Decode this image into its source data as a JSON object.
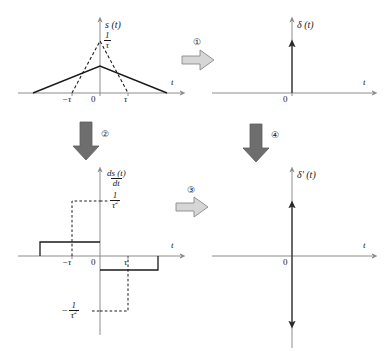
{
  "figure": {
    "colors": {
      "axis": "#8c8c8c",
      "curve": "#1a1a1a",
      "dashed": "#1a1a1a",
      "arrow_light_fill": "#d4d4d4",
      "arrow_light_stroke": "#8a8a8a",
      "arrow_dark_fill": "#6e6e6e",
      "text": "#1a1a1a"
    },
    "panels": [
      {
        "id": "panel-s-t",
        "position": "top-left",
        "y_axis_label": "s (t)",
        "x_axis_label": "t",
        "origin_label": "0",
        "tick_labels": [
          "−τ",
          "τ"
        ],
        "value_label_numerator": "1",
        "value_label_denominator": "τ",
        "description": "Triangular pulse of unit area, solid wide low triangle and dashed narrow tall triangle peaking at 1/τ"
      },
      {
        "id": "panel-delta-t",
        "position": "top-right",
        "y_axis_label": "δ (t)",
        "x_axis_label": "t",
        "origin_label": "0",
        "description": "Unit impulse: single upward arrow at t = 0"
      },
      {
        "id": "panel-ds-dt",
        "position": "bottom-left",
        "y_axis_label_numerator": "ds (t)",
        "y_axis_label_denominator": "dt",
        "x_axis_label": "t",
        "origin_label": "0",
        "tick_labels": [
          "−τ",
          "τ"
        ],
        "upper_value_numerator": "1",
        "upper_value_denominator": "τ",
        "upper_value_exponent": "2",
        "lower_value_sign": "−",
        "lower_value_numerator": "1",
        "lower_value_denominator": "τ",
        "lower_value_exponent": "2",
        "description": "Derivative of the triangular pulse: positive rectangle for t<0, negative rectangle for t>0; dashed taller/narrower pair reaching ±1/τ²"
      },
      {
        "id": "panel-delta-prime-t",
        "position": "bottom-right",
        "y_axis_label": "δ' (t)",
        "x_axis_label": "t",
        "origin_label": "0",
        "description": "Unit doublet: upward arrow and downward arrow at t = 0"
      }
    ],
    "step_arrows": [
      {
        "id": "step-1",
        "label": "①",
        "direction": "right",
        "style": "light",
        "from": "panel-s-t",
        "to": "panel-delta-t"
      },
      {
        "id": "step-2",
        "label": "②",
        "direction": "down",
        "style": "dark",
        "from": "panel-s-t",
        "to": "panel-ds-dt"
      },
      {
        "id": "step-3",
        "label": "③",
        "direction": "right",
        "style": "light",
        "from": "panel-ds-dt",
        "to": "panel-delta-prime-t"
      },
      {
        "id": "step-4",
        "label": "④",
        "direction": "down",
        "style": "dark",
        "from": "panel-delta-t",
        "to": "panel-delta-prime-t"
      }
    ]
  }
}
